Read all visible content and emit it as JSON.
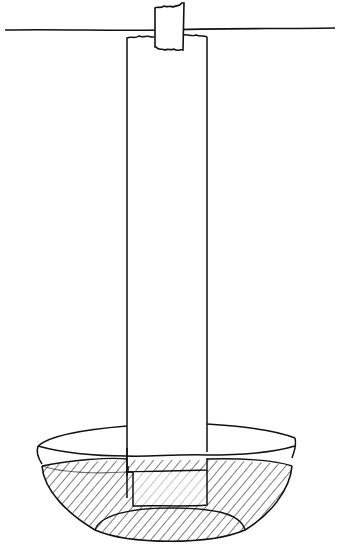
{
  "figure": {
    "description": "Hand-drawn illustration of a paper strip taped to a horizontal support line, hanging down with its lower end immersed in a bowl of liquid",
    "style": "black ink line drawing on white",
    "colors": {
      "ink": "#111111",
      "background": "#ffffff"
    },
    "elements": {
      "support_line": "horizontal line across top",
      "tape": "small piece of tape with torn edges holding the strip",
      "paper_strip": "long vertical rectangular strip",
      "bowl": "shallow bowl shown in perspective",
      "liquid": "hatched liquid in bowl",
      "submerged_section": "lower end of strip under liquid surface"
    }
  }
}
